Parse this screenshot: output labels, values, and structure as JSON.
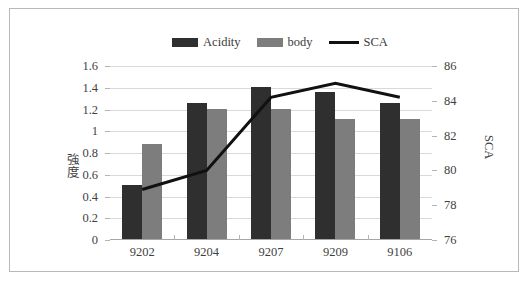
{
  "chart_data": {
    "type": "bar",
    "title": "",
    "subtitle": "",
    "categories": [
      "9202",
      "9204",
      "9207",
      "9209",
      "9106"
    ],
    "xlabel": "",
    "ylabel": "強度",
    "y2label": "SCA",
    "ylim": [
      0,
      1.6
    ],
    "y2lim": [
      76,
      86
    ],
    "yticks": [
      "0",
      "0.2",
      "0.4",
      "0.6",
      "0.8",
      "1",
      "1.2",
      "1.4",
      "1.6"
    ],
    "ytick_values": [
      0,
      0.2,
      0.4,
      0.6,
      0.8,
      1.0,
      1.2,
      1.4,
      1.6
    ],
    "y2ticks": [
      "76",
      "78",
      "80",
      "82",
      "84",
      "86"
    ],
    "y2tick_values": [
      76,
      78,
      80,
      82,
      84,
      86
    ],
    "grid": true,
    "legend_position": "top-center",
    "series": [
      {
        "name": "Acidity",
        "type": "bar",
        "axis": "left",
        "color": "#2f2f2f",
        "values": [
          0.5,
          1.25,
          1.4,
          1.35,
          1.25
        ]
      },
      {
        "name": "body",
        "type": "bar",
        "axis": "left",
        "color": "#7d7d7d",
        "values": [
          0.87,
          1.2,
          1.2,
          1.1,
          1.1
        ]
      },
      {
        "name": "SCA",
        "type": "line",
        "axis": "right",
        "color": "#111111",
        "values": [
          78.9,
          80.0,
          84.2,
          85.0,
          84.2
        ]
      }
    ]
  },
  "legend": {
    "items": [
      {
        "label": "Acidity",
        "marker": "bar-swatch",
        "color": "#2f2f2f"
      },
      {
        "label": "body",
        "marker": "bar-swatch",
        "color": "#7d7d7d"
      },
      {
        "label": "SCA",
        "marker": "line-swatch",
        "color": "#111111"
      }
    ]
  },
  "axes": {
    "left_title": "強度",
    "right_title": "SCA"
  },
  "colors": {
    "acidity": "#2f2f2f",
    "body": "#7d7d7d",
    "sca_line": "#111111",
    "grid": "#d9d9d9",
    "axis": "#a6a6a6",
    "frame": "#b8b8b8",
    "background": "#ffffff",
    "text": "#3f3f3f"
  }
}
